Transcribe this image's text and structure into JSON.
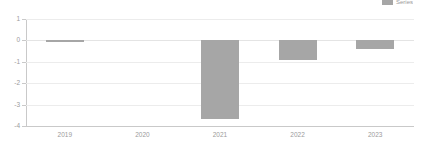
{
  "legend": {
    "label": "Series",
    "swatch_color": "#a6a6a6",
    "position": "top-right",
    "clipped": true
  },
  "axes": {
    "y_ticks": [
      "1",
      "0",
      "-1",
      "-2",
      "-3",
      "-4"
    ],
    "x_ticks": [
      "2019",
      "2020",
      "2021",
      "2022",
      "2023"
    ]
  },
  "colors": {
    "bar": "#a6a6a6",
    "gridline": "#ececec",
    "axis": "#c9c9c9",
    "tick_label": "#9b9b9b",
    "background": "#ffffff"
  },
  "chart_data": {
    "type": "bar",
    "title": "",
    "subtitle": "",
    "xlabel": "",
    "ylabel": "",
    "categories": [
      "2019",
      "2020",
      "2021",
      "2022",
      "2023"
    ],
    "values": [
      -0.02,
      0,
      -3.67,
      -0.92,
      -0.42
    ],
    "series": [
      {
        "name": "Series",
        "color": "#a6a6a6",
        "values": [
          -0.02,
          0,
          -3.67,
          -0.92,
          -0.42
        ]
      }
    ],
    "ylim": [
      -4,
      1
    ],
    "yticks": [
      1,
      0,
      -1,
      -2,
      -3,
      -4
    ],
    "grid": true,
    "legend_position": "top-right"
  }
}
